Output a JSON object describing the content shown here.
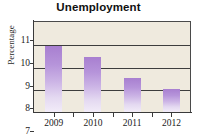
{
  "chart_data": {
    "type": "bar",
    "title": "Unemployment",
    "xlabel": "",
    "ylabel": "Percentage",
    "categories": [
      "2009",
      "2010",
      "2011",
      "2012"
    ],
    "values": [
      9.9,
      9.4,
      8.5,
      8.0
    ],
    "ylim": [
      7,
      11
    ],
    "yticks": [
      7,
      8,
      9,
      10,
      11
    ],
    "ytick_labels": [
      "7",
      "8",
      "9",
      "10",
      "11"
    ],
    "grid": true,
    "legend": "none",
    "colors": {
      "bar_top": "#a87fd0",
      "bar_bottom": "#f2ecf8",
      "plot_background": "#efeade",
      "figure_background": "#ffffff",
      "axis": "#3a3a3a"
    }
  }
}
